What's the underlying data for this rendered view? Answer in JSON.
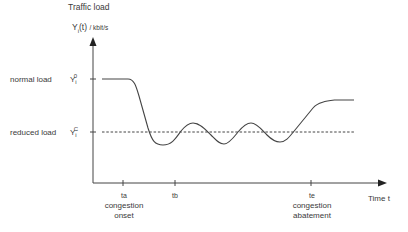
{
  "title": "Traffic load",
  "y_axis": {
    "label": "Y",
    "sub": "i",
    "suffix": "(t)",
    "unit": "/ kbit/s"
  },
  "x_axis": {
    "label": "Time t"
  },
  "levels": [
    {
      "name": "normal load",
      "symbol": "Y",
      "sub": "i",
      "sup": "0"
    },
    {
      "name": "reduced load",
      "symbol": "Y",
      "sub": "i",
      "sup": "C"
    }
  ],
  "ticks": [
    {
      "symbol": "ta",
      "caption_line1": "congestion",
      "caption_line2": "onset"
    },
    {
      "symbol": "tb",
      "caption_line1": "",
      "caption_line2": ""
    },
    {
      "symbol": "te",
      "caption_line1": "congestion",
      "caption_line2": "abatement"
    }
  ],
  "colors": {
    "axis": "#444444",
    "curve": "#444444",
    "dashed": "#444444"
  }
}
